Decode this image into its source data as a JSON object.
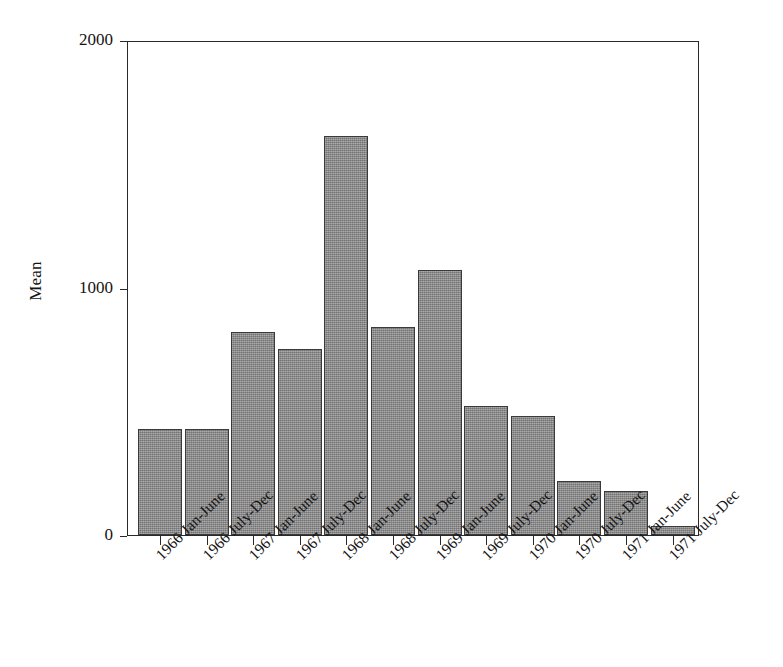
{
  "chart_data": {
    "type": "bar",
    "title": "",
    "subtitle": "",
    "xlabel": "",
    "ylabel": "Mean",
    "categories": [
      "1966 Jan-June",
      "1966 July-Dec",
      "1967 Jan-June",
      "1967 July-Dec",
      "1968 Jan-June",
      "1968 July-Dec",
      "1969 Jan-June",
      "1969 July-Dec",
      "1970 Jan-June",
      "1970 July-Dec",
      "1971 Jan-June",
      "1971 July-Dec"
    ],
    "values": [
      428,
      428,
      820,
      752,
      1612,
      840,
      1071,
      521,
      481,
      218,
      178,
      36
    ],
    "ylim": [
      0,
      2000
    ],
    "ytick_values": [
      0,
      1000,
      2000
    ],
    "ytick_labels": [
      "0",
      "1000",
      "2000"
    ],
    "grid": false,
    "legend": null,
    "bar_color": "#8b8b8b",
    "bar_edge_color": "#3a3a3a",
    "axis_color": "#2a2a2a",
    "background_color": "#ffffff",
    "annotations": []
  },
  "axes": {
    "y_title": "Mean"
  }
}
